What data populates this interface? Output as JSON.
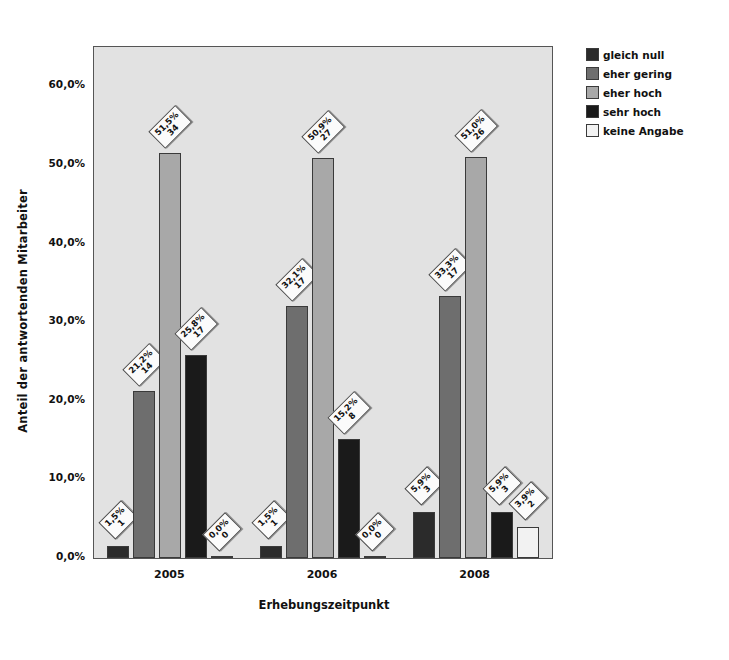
{
  "chart_data": {
    "type": "bar",
    "title": "",
    "xlabel": "Erhebungszeitpunkt",
    "ylabel": "Anteil der antwortenden Mitarbeiter",
    "categories": [
      "2005",
      "2006",
      "2008"
    ],
    "ytick_labels": [
      "0,0%",
      "10,0%",
      "20,0%",
      "30,0%",
      "40,0%",
      "50,0%",
      "60,0%"
    ],
    "ytick_values": [
      0,
      10,
      20,
      30,
      40,
      50,
      60
    ],
    "ylim": [
      0,
      65
    ],
    "grid": false,
    "legend_position": "right",
    "series": [
      {
        "name": "gleich null",
        "color": "#2b2b2b",
        "values": [
          1.5,
          1.5,
          5.9
        ],
        "counts": [
          1,
          1,
          3
        ],
        "labels": [
          "1,5%",
          "1,5%",
          "5,9%"
        ],
        "count_labels": [
          "1",
          "1",
          "3"
        ]
      },
      {
        "name": "eher gering",
        "color": "#6e6e6e",
        "values": [
          21.2,
          32.1,
          33.3
        ],
        "counts": [
          14,
          17,
          17
        ],
        "labels": [
          "21,2%",
          "32,1%",
          "33,3%"
        ],
        "count_labels": [
          "14",
          "17",
          "17"
        ]
      },
      {
        "name": "eher hoch",
        "color": "#a8a8a8",
        "values": [
          51.5,
          50.9,
          51.0
        ],
        "counts": [
          34,
          27,
          26
        ],
        "labels": [
          "51,5%",
          "50,9%",
          "51,0%"
        ],
        "count_labels": [
          "34",
          "27",
          "26"
        ]
      },
      {
        "name": "sehr hoch",
        "color": "#1a1a1a",
        "values": [
          25.8,
          15.2,
          5.9
        ],
        "counts": [
          17,
          8,
          3
        ],
        "labels": [
          "25,8%",
          "15,2%",
          "5,9%"
        ],
        "count_labels": [
          "17",
          "8",
          "3"
        ]
      },
      {
        "name": "keine Angabe",
        "color": "#f2f2f2",
        "values": [
          0.0,
          0.0,
          3.9
        ],
        "counts": [
          0,
          0,
          2
        ],
        "labels": [
          "0,0%",
          "0,0%",
          "3,9%"
        ],
        "count_labels": [
          "0",
          "0",
          "2"
        ]
      }
    ]
  },
  "legend": {
    "items": [
      {
        "label": "gleich null"
      },
      {
        "label": "eher gering"
      },
      {
        "label": "eher hoch"
      },
      {
        "label": "sehr hoch"
      },
      {
        "label": "keine Angabe"
      }
    ]
  }
}
